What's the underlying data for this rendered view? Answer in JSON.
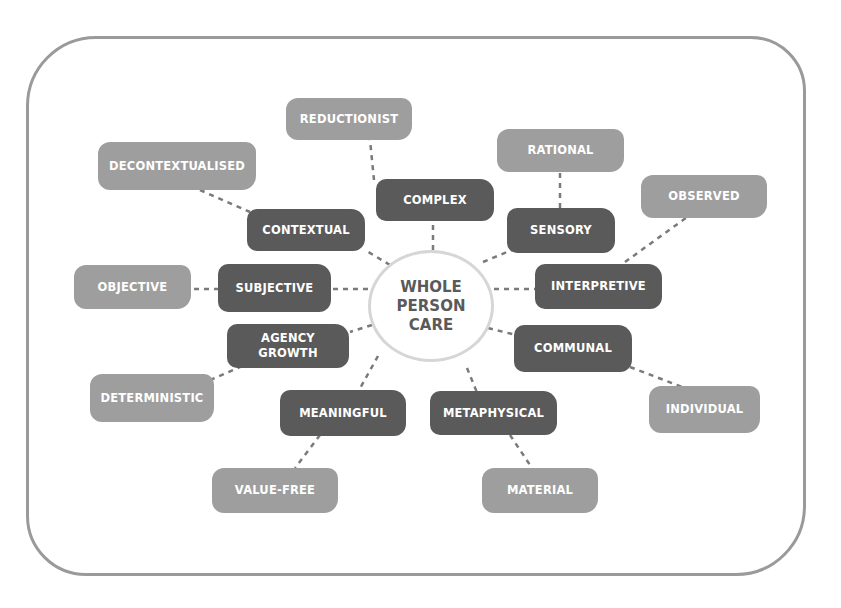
{
  "diagram": {
    "center": {
      "lines": [
        "WHOLE",
        "PERSON",
        "CARE"
      ]
    },
    "inner_nodes": [
      {
        "id": "complex",
        "label": "COMPLEX"
      },
      {
        "id": "contextual",
        "label": "CONTEXTUAL"
      },
      {
        "id": "sensory",
        "label": "SENSORY"
      },
      {
        "id": "subjective",
        "label": "SUBJECTIVE"
      },
      {
        "id": "interpretive",
        "label": "INTERPRETIVE"
      },
      {
        "id": "agency_growth",
        "label": "AGENCY GROWTH",
        "lines": [
          "AGENCY",
          "GROWTH"
        ]
      },
      {
        "id": "communal",
        "label": "COMMUNAL"
      },
      {
        "id": "meaningful",
        "label": "MEANINGFUL"
      },
      {
        "id": "metaphysical",
        "label": "METAPHYSICAL"
      }
    ],
    "outer_nodes": [
      {
        "id": "reductionist",
        "label": "REDUCTIONIST",
        "opposes": "complex"
      },
      {
        "id": "decontextualised",
        "label": "DECONTEXTUALISED",
        "opposes": "contextual"
      },
      {
        "id": "rational",
        "label": "RATIONAL",
        "opposes": "sensory"
      },
      {
        "id": "observed",
        "label": "OBSERVED",
        "opposes": "interpretive"
      },
      {
        "id": "objective",
        "label": "OBJECTIVE",
        "opposes": "subjective"
      },
      {
        "id": "deterministic",
        "label": "DETERMINISTIC",
        "opposes": "agency_growth"
      },
      {
        "id": "individual",
        "label": "INDIVIDUAL",
        "opposes": "communal"
      },
      {
        "id": "value_free",
        "label": "VALUE-FREE",
        "opposes": "meaningful"
      },
      {
        "id": "material",
        "label": "MATERIAL",
        "opposes": "metaphysical"
      }
    ],
    "colors": {
      "inner": "#5a5a5a",
      "outer": "#9e9e9e",
      "center_border": "#d6d6d6",
      "frame": "#9a9a9a",
      "link": "#7a7a7a"
    }
  }
}
